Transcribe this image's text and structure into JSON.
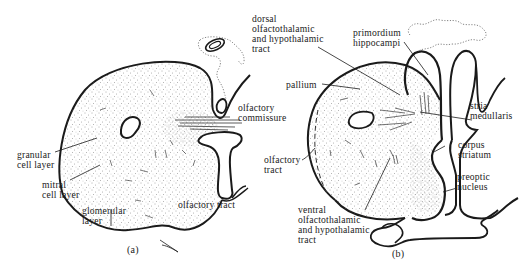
{
  "figure": {
    "panels": [
      {
        "id": "a",
        "caption": "(a)",
        "labels": {
          "olfactory_commissure": "olfactory\ncommissure",
          "granular_cell_layer": "granular\ncell layer",
          "mitral_cell_layer": "mitral\ncell layer",
          "glomerular_layer": "glomerular\nlayer",
          "olfactory_tract": "olfactory tract"
        }
      },
      {
        "id": "b",
        "caption": "(b)",
        "labels": {
          "dorsal_tract": "dorsal\nolfactothalamic\nand hypothalamic\ntract",
          "primordium_hippocampi": "primordium\nhippocampi",
          "pallium": "pallium",
          "stria_medullaris": "stria\nmedullaris",
          "olfactory_tract": "olfactory\ntract",
          "corpus_striatum": "corpus\nstriatum",
          "preoptic_nucleus": "preoptic\nnucleus",
          "ventral_tract": "ventral\nolfactothalamic\nand hypothalamic\ntract"
        }
      }
    ]
  },
  "style": {
    "ink": "#1a1a1a",
    "stipple": "#5a5a5a"
  }
}
